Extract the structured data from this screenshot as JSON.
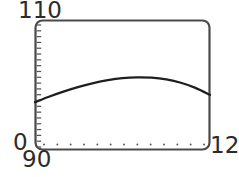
{
  "chart_data": {
    "type": "line",
    "title": "",
    "subtitle": "",
    "xlabel": "",
    "ylabel": "",
    "grid": false,
    "legend": false,
    "legend_position": "none",
    "xlim": [
      90,
      12
    ],
    "ylim": [
      0,
      110
    ],
    "axis_labels": {
      "y_max": "110",
      "y_min": "0",
      "x_min": "90",
      "x_max": "12"
    },
    "x_tick_count": 13,
    "y_tick_count": 22,
    "x": [
      90,
      91.83,
      93.67,
      95.5,
      97.33,
      99.17,
      101,
      102.83,
      104.67,
      106.5,
      108.33,
      110.17,
      112
    ],
    "series": [
      {
        "name": "curve",
        "color": "#1f1f1f",
        "values": [
          40.5,
          45.3,
          49.6,
          53.4,
          56.6,
          59.1,
          60.8,
          61.5,
          61.2,
          59.7,
          56.9,
          52.6,
          46.7
        ]
      }
    ],
    "annotations": []
  },
  "style": {
    "frame_color": "#4a4a4a",
    "curve_color": "#1f1f1f",
    "tick_color": "#555555",
    "text_color": "#2b2b2b",
    "background": "#ffffff"
  },
  "geometry": {
    "plot_left": 35,
    "plot_right": 210,
    "plot_top": 20,
    "plot_bottom": 150,
    "corner_radius": 7
  }
}
